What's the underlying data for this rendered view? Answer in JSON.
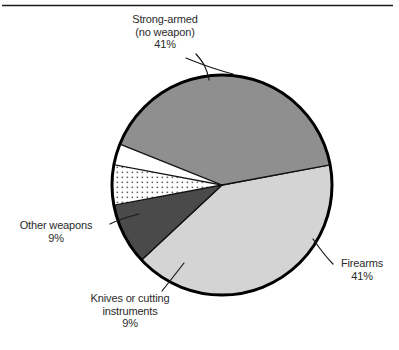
{
  "figure": {
    "has_top_rule": true,
    "background_color": "#ffffff",
    "text_color": "#2b2b2b",
    "outline_color": "#000000"
  },
  "chart_data": {
    "type": "pie",
    "title": "",
    "subtitle": "",
    "xlabel": "",
    "ylabel": "",
    "legend_position": "none",
    "grid": false,
    "value_suffix": "%",
    "center": {
      "x": 222,
      "y": 185
    },
    "radius": 110,
    "categories": [
      "Strong-armed (no weapon)",
      "Firearms",
      "Knives or cutting instruments",
      "Other weapons"
    ],
    "values": [
      41,
      41,
      9,
      9
    ],
    "slices": [
      {
        "name": "strong-armed",
        "label_lines": [
          "Strong-armed",
          "(no weapon)"
        ],
        "value": 41,
        "value_text": "41%",
        "color": "#d4d4d4",
        "pattern": "solid",
        "start_angle_deg": 223.0,
        "end_angle_deg": 370.6
      },
      {
        "name": "firearms",
        "label_lines": [
          "Firearms"
        ],
        "value": 41,
        "value_text": "41%",
        "color": "#8f8f8f",
        "pattern": "solid",
        "start_angle_deg": 10.6,
        "end_angle_deg": 158.2
      },
      {
        "name": "knives-or-cutting-instruments",
        "label_lines": [
          "Knives or cutting",
          "instruments"
        ],
        "value": 9,
        "value_text": "9%",
        "color": "#ffffff",
        "pattern": "dotted",
        "start_angle_deg": 158.2,
        "end_angle_deg": 190.6
      },
      {
        "name": "other-weapons",
        "label_lines": [
          "Other weapons"
        ],
        "value": 9,
        "value_text": "9%",
        "color": "#4a4a4a",
        "pattern": "solid",
        "start_angle_deg": 190.6,
        "end_angle_deg": 223.0
      }
    ]
  },
  "labels": {
    "strong_armed": {
      "line1": "Strong-armed",
      "line2": "(no weapon)",
      "line3": "41%"
    },
    "firearms": {
      "line1": "Firearms",
      "line2": "41%"
    },
    "other_weapons": {
      "line1": "Other weapons",
      "line2": "9%"
    },
    "knives": {
      "line1": "Knives or cutting",
      "line2": "instruments",
      "line3": "9%"
    }
  }
}
